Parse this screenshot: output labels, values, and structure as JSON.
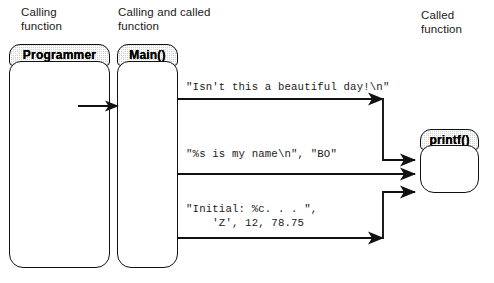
{
  "diagram": {
    "captions": {
      "calling_function": "Calling\nfunction",
      "calling_and_called_function": "Calling and called\nfunction",
      "called_function": "Called\nfunction"
    },
    "boxes": [
      {
        "id": "programmer",
        "label": "Programmer"
      },
      {
        "id": "main",
        "label": "Main()"
      },
      {
        "id": "printf",
        "label": "printf()"
      }
    ],
    "calls": [
      {
        "id": "call-1",
        "arguments": "\"Isn't this a beautiful day!\\n\""
      },
      {
        "id": "call-2",
        "arguments": "\"%s is my name\\n\", \"BO\""
      },
      {
        "id": "call-3",
        "arguments": "\"Initial: %c. . . \",\n    'Z', 12, 78.75"
      }
    ],
    "colors": {
      "stroke": "#111111",
      "header_fill": "#d2d2d2",
      "body_fill": "#ffffff",
      "text": "#1a1a1a"
    }
  }
}
